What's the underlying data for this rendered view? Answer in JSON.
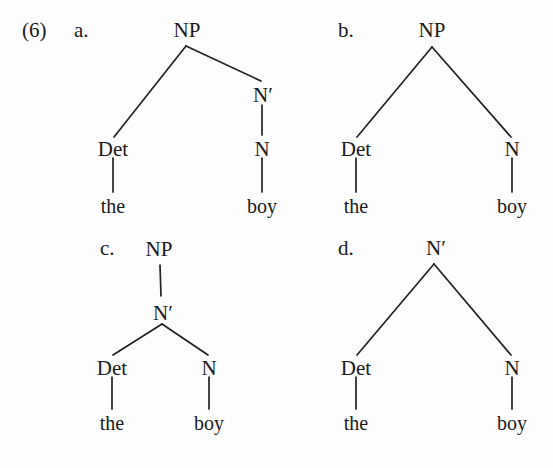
{
  "page": {
    "background_color": "#fdfdfd",
    "ink_color": "#1b1b1b",
    "example_number": "(6)"
  },
  "trees": {
    "a": {
      "item_label": "a.",
      "root": "NP",
      "nodes": {
        "np": "NP",
        "nbar": "N′",
        "det": "Det",
        "n": "N"
      },
      "leaves": {
        "det_leaf": "the",
        "n_leaf": "boy"
      },
      "description": "NP branches to Det and N-bar; N-bar dominates N; asymmetric long left branch"
    },
    "b": {
      "item_label": "b.",
      "root": "NP",
      "nodes": {
        "np": "NP",
        "det": "Det",
        "n": "N"
      },
      "leaves": {
        "det_leaf": "the",
        "n_leaf": "boy"
      },
      "description": "NP branches directly to Det and N"
    },
    "c": {
      "item_label": "c.",
      "root": "NP",
      "nodes": {
        "np": "NP",
        "nbar": "N′",
        "det": "Det",
        "n": "N"
      },
      "leaves": {
        "det_leaf": "the",
        "n_leaf": "boy"
      },
      "description": "NP dominates N-bar; N-bar branches to Det and N"
    },
    "d": {
      "item_label": "d.",
      "root": "N′",
      "nodes": {
        "nbar": "N′",
        "det": "Det",
        "n": "N"
      },
      "leaves": {
        "det_leaf": "the",
        "n_leaf": "boy"
      },
      "description": "N-bar branches to Det and N"
    }
  }
}
